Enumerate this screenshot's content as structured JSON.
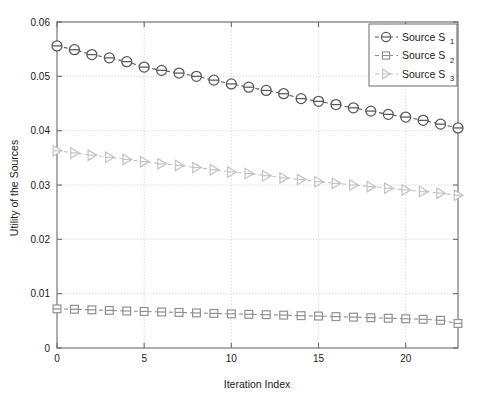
{
  "chart_data": {
    "type": "line",
    "title": "",
    "xlabel": "Iteration Index",
    "ylabel": "Utility of the Sources",
    "xlim": [
      0,
      23
    ],
    "ylim": [
      0,
      0.06
    ],
    "grid": true,
    "legend_position": "top-right",
    "xticks": [
      0,
      5,
      10,
      15,
      20
    ],
    "xtick_labels": [
      "0",
      "5",
      "10",
      "15",
      "20"
    ],
    "yticks": [
      0,
      0.01,
      0.02,
      0.03,
      0.04,
      0.05,
      0.06
    ],
    "ytick_labels": [
      "0",
      "0.01",
      "0.02",
      "0.03",
      "0.04",
      "0.05",
      "0.06"
    ],
    "x": [
      0,
      1,
      2,
      3,
      4,
      5,
      6,
      7,
      8,
      9,
      10,
      11,
      12,
      13,
      14,
      15,
      16,
      17,
      18,
      19,
      20,
      21,
      22,
      23
    ],
    "series": [
      {
        "name": "Source S_1",
        "legend_base": "Source S",
        "legend_sub": "1",
        "marker": "circle",
        "color": "#575757",
        "linestyle": "dashed",
        "values": [
          0.0556,
          0.0549,
          0.054,
          0.0534,
          0.0527,
          0.0517,
          0.0511,
          0.0506,
          0.05,
          0.0493,
          0.0486,
          0.048,
          0.0474,
          0.0468,
          0.0459,
          0.0454,
          0.0448,
          0.0442,
          0.0436,
          0.043,
          0.0425,
          0.0419,
          0.0412,
          0.0405
        ]
      },
      {
        "name": "Source S_2",
        "legend_base": "Source S",
        "legend_sub": "2",
        "marker": "square",
        "color": "#909090",
        "linestyle": "dashed",
        "values": [
          0.0072,
          0.00713,
          0.00702,
          0.00692,
          0.00681,
          0.00673,
          0.00663,
          0.00655,
          0.00645,
          0.00637,
          0.00628,
          0.0062,
          0.00613,
          0.00605,
          0.00595,
          0.00588,
          0.00578,
          0.00568,
          0.00558,
          0.00548,
          0.00538,
          0.00528,
          0.0051,
          0.00452
        ]
      },
      {
        "name": "Source S_3",
        "legend_base": "Source S",
        "legend_sub": "3",
        "marker": "triangle-right",
        "color": "#c3c3c3",
        "linestyle": "dashed",
        "values": [
          0.0363,
          0.0359,
          0.0355,
          0.0351,
          0.0347,
          0.0343,
          0.0339,
          0.0336,
          0.0332,
          0.0328,
          0.0324,
          0.0321,
          0.0317,
          0.0313,
          0.031,
          0.0306,
          0.0303,
          0.03,
          0.0297,
          0.0294,
          0.0291,
          0.0288,
          0.0285,
          0.0281
        ]
      }
    ]
  },
  "axes": {
    "x_title": "Iteration Index",
    "y_title": "Utility of the Sources"
  },
  "legend": {
    "items": [
      {
        "label": "Source S",
        "sub": "1"
      },
      {
        "label": "Source S",
        "sub": "2"
      },
      {
        "label": "Source S",
        "sub": "3"
      }
    ]
  },
  "colors": {
    "series1": "#575757",
    "series2": "#909090",
    "series3": "#c3c3c3",
    "axis": "#6b6b6b",
    "grid": "#bdbdbd",
    "text": "#1a1a1a",
    "background": "#ffffff"
  }
}
